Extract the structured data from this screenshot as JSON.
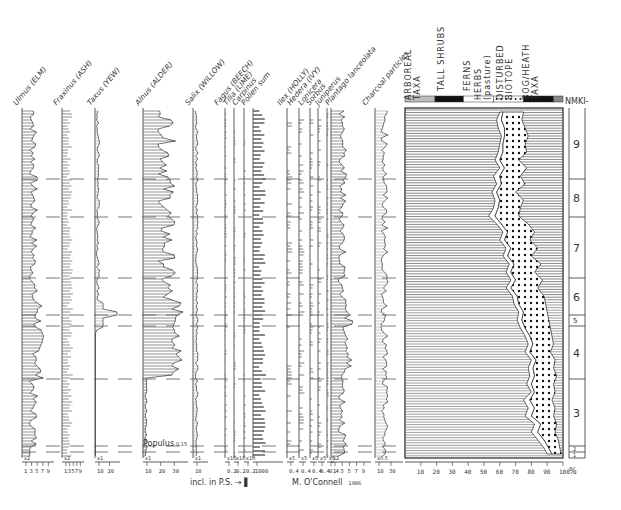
{
  "chart_data": {
    "type": "pollen-diagram",
    "title": "",
    "author": "M. O'Connell",
    "year": "1986",
    "footnote": "incl. in P.S. →",
    "taxa": [
      {
        "name": "Ulmus (ELM)",
        "exaggeration": "x2",
        "ticks": [
          "1",
          "3",
          "5",
          "7",
          "9"
        ]
      },
      {
        "name": "Fraxinus (ASH)",
        "exaggeration": "x2",
        "ticks": [
          "1",
          "3",
          "5",
          "7",
          "9"
        ]
      },
      {
        "name": "Taxus (YEW)",
        "exaggeration": "x1",
        "ticks": [
          "10",
          "20"
        ]
      },
      {
        "name": "Alnus (ALDER)",
        "exaggeration": "x1",
        "ticks": [
          "10",
          "20",
          "30"
        ]
      },
      {
        "name": "Salix (WILLOW)",
        "exaggeration": "x1",
        "ticks": [
          "10"
        ]
      },
      {
        "name": "Fagus (BEECH)",
        "exaggeration": "x10",
        "ticks": [
          "0.2"
        ]
      },
      {
        "name": "Tilia (LIME)",
        "exaggeration": "x10",
        "ticks": [
          "0.2"
        ]
      },
      {
        "name": "Carpinus",
        "exaggeration": "x10",
        "ticks": [
          "0.2"
        ]
      },
      {
        "name": "Pollen sum",
        "exaggeration": "",
        "ticks": [
          "1000"
        ]
      },
      {
        "name": "Ilex (HOLLY)",
        "exaggeration": "x5",
        "ticks": [
          "0.4"
        ]
      },
      {
        "name": "Hedera (IVY)",
        "exaggeration": "x5",
        "ticks": [
          "0.4"
        ]
      },
      {
        "name": "Lonicera",
        "exaggeration": "x5",
        "ticks": [
          "0.4"
        ]
      },
      {
        "name": "Sorbus",
        "exaggeration": "x5",
        "ticks": [
          "0.4"
        ]
      },
      {
        "name": "Juniperus",
        "exaggeration": "x5",
        "ticks": [
          "0.4"
        ]
      },
      {
        "name": "Plantago lanceolata",
        "exaggeration": "x2",
        "ticks": [
          "1",
          "3",
          "5",
          "7",
          "9"
        ]
      },
      {
        "name": "Charcoal particles",
        "exaggeration": "x0.5",
        "ticks": [
          "10",
          "30"
        ]
      }
    ],
    "annotation": {
      "label": "Populus",
      "value": "0.15"
    },
    "summary_groups": [
      "ARBOREAL TAXA",
      "TALL SHRUBS",
      "FERNS",
      "HERBS (pasture)",
      "DISTURBED BIOTOPE",
      "BOG/HEATH TAXA"
    ],
    "summary_xaxis": {
      "ticks": [
        "10",
        "20",
        "30",
        "40",
        "50",
        "60",
        "70",
        "80",
        "90",
        "100"
      ],
      "unit": "%",
      "range": [
        0,
        100
      ]
    },
    "zone_prefix": "NMKI-",
    "zones": [
      {
        "id": "9",
        "top": 108,
        "bottom": 179
      },
      {
        "id": "8",
        "top": 179,
        "bottom": 217
      },
      {
        "id": "7",
        "top": 217,
        "bottom": 278
      },
      {
        "id": "6",
        "top": 278,
        "bottom": 315
      },
      {
        "id": "5",
        "top": 315,
        "bottom": 326
      },
      {
        "id": "4",
        "top": 326,
        "bottom": 379
      },
      {
        "id": "3",
        "top": 379,
        "bottom": 446
      },
      {
        "id": "2",
        "top": 446,
        "bottom": 452
      },
      {
        "id": "1",
        "top": 452,
        "bottom": 458
      }
    ],
    "zone_boundaries_y": [
      179,
      217,
      278,
      315,
      326,
      379,
      446,
      452
    ],
    "summary_profile": {
      "depth_y": [
        112,
        120,
        128,
        136,
        144,
        152,
        160,
        168,
        176,
        184,
        192,
        200,
        208,
        216,
        224,
        232,
        240,
        248,
        256,
        264,
        272,
        280,
        288,
        296,
        304,
        312,
        320,
        328,
        336,
        344,
        352,
        360,
        368,
        376,
        384,
        392,
        400,
        408,
        416,
        424,
        432,
        440,
        448,
        454
      ],
      "arboreal_pct": [
        60,
        58,
        59,
        61,
        60,
        59,
        57,
        60,
        56,
        58,
        55,
        57,
        56,
        53,
        58,
        62,
        60,
        64,
        62,
        66,
        64,
        67,
        64,
        68,
        69,
        72,
        71,
        73,
        76,
        78,
        76,
        80,
        78,
        79,
        77,
        80,
        75,
        78,
        76,
        82,
        80,
        84,
        88,
        90
      ],
      "herbs_start_pct": [
        62,
        61,
        63,
        63,
        62,
        62,
        60,
        63,
        60,
        61,
        58,
        60,
        59,
        57,
        61,
        65,
        63,
        67,
        65,
        69,
        67,
        70,
        67,
        71,
        72,
        75,
        74,
        76,
        79,
        81,
        79,
        83,
        81,
        82,
        80,
        82,
        79,
        82,
        80,
        86,
        84,
        88,
        91,
        93
      ],
      "herbs_end_pct": [
        75,
        74,
        76,
        78,
        76,
        77,
        72,
        77,
        73,
        76,
        70,
        75,
        73,
        72,
        78,
        82,
        79,
        84,
        80,
        86,
        82,
        87,
        84,
        88,
        89,
        90,
        91,
        92,
        93,
        94,
        92,
        95,
        94,
        96,
        94,
        95,
        93,
        95,
        94,
        96,
        95,
        97,
        98,
        99
      ]
    }
  },
  "figure": {
    "footer_text": "incl. in P.S.",
    "author_credit": "M. O'Connell",
    "year": "1986",
    "percent_symbol": "%"
  }
}
